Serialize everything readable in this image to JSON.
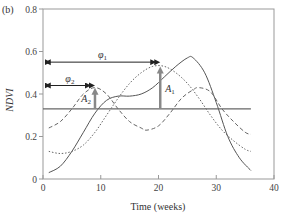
{
  "panel_label": "(b)",
  "chart_data": {
    "type": "line",
    "title": "",
    "xlabel": "Time (weeks)",
    "ylabel": "NDVI",
    "xlim": [
      0,
      40
    ],
    "ylim": [
      0,
      0.8
    ],
    "x_ticks": [
      0,
      10,
      20,
      30,
      40
    ],
    "x_tick_labels": [
      "0",
      "10",
      "20",
      "30",
      "40"
    ],
    "y_ticks": [
      0,
      0.2,
      0.4,
      0.6,
      0.8
    ],
    "y_tick_labels": [
      "0",
      "0.2",
      "0.4",
      "0.6",
      "0.8"
    ],
    "grid": false,
    "legend": null,
    "series": [
      {
        "name": "NDVI profile",
        "style": "solid",
        "color": "#555555",
        "x": [
          1,
          3,
          5,
          7,
          9,
          11,
          13,
          15,
          17,
          19,
          21,
          23,
          25,
          26,
          28,
          30,
          32,
          34,
          36
        ],
        "y": [
          0.03,
          0.06,
          0.13,
          0.22,
          0.31,
          0.37,
          0.39,
          0.39,
          0.4,
          0.43,
          0.48,
          0.53,
          0.57,
          0.57,
          0.5,
          0.36,
          0.2,
          0.1,
          0.04
        ]
      },
      {
        "name": "Harmonic 2 (phase phi2, amplitude A2)",
        "style": "dashed",
        "color": "#666666",
        "x": [
          1,
          3,
          5,
          7,
          9,
          11,
          13,
          15,
          17,
          18,
          20,
          22,
          24,
          26,
          27,
          29,
          31,
          33,
          35,
          36
        ],
        "y": [
          0.24,
          0.27,
          0.33,
          0.4,
          0.43,
          0.4,
          0.33,
          0.27,
          0.24,
          0.23,
          0.25,
          0.31,
          0.38,
          0.42,
          0.43,
          0.41,
          0.33,
          0.27,
          0.22,
          0.21
        ]
      },
      {
        "name": "Harmonic 1 (phase phi1, amplitude A1)",
        "style": "dotted",
        "color": "#666666",
        "x": [
          1,
          3,
          5,
          7,
          9,
          11,
          13,
          15,
          17,
          19,
          21,
          23,
          25,
          27,
          29,
          31,
          33,
          35,
          36
        ],
        "y": [
          0.13,
          0.12,
          0.13,
          0.16,
          0.22,
          0.3,
          0.38,
          0.45,
          0.5,
          0.53,
          0.53,
          0.5,
          0.45,
          0.38,
          0.3,
          0.23,
          0.18,
          0.14,
          0.13
        ]
      },
      {
        "name": "Mean NDVI",
        "style": "solid-horizontal",
        "color": "#666666",
        "x": [
          0,
          36
        ],
        "y": [
          0.33,
          0.33
        ]
      }
    ],
    "annotations": [
      {
        "id": "phi1",
        "type": "double-arrow-horizontal",
        "label": "φ",
        "sub": "1",
        "x_start": 0.3,
        "x_end": 20.3,
        "y": 0.55
      },
      {
        "id": "phi2",
        "type": "double-arrow-horizontal",
        "label": "φ",
        "sub": "2",
        "x_start": 0.3,
        "x_end": 9.0,
        "y": 0.44
      },
      {
        "id": "A1",
        "type": "arrow-vertical",
        "label": "A",
        "sub": "1",
        "x": 20.3,
        "y_start": 0.33,
        "y_end": 0.53
      },
      {
        "id": "A2",
        "type": "arrow-vertical",
        "label": "A",
        "sub": "2",
        "x": 9.0,
        "y_start": 0.33,
        "y_end": 0.43
      }
    ]
  }
}
